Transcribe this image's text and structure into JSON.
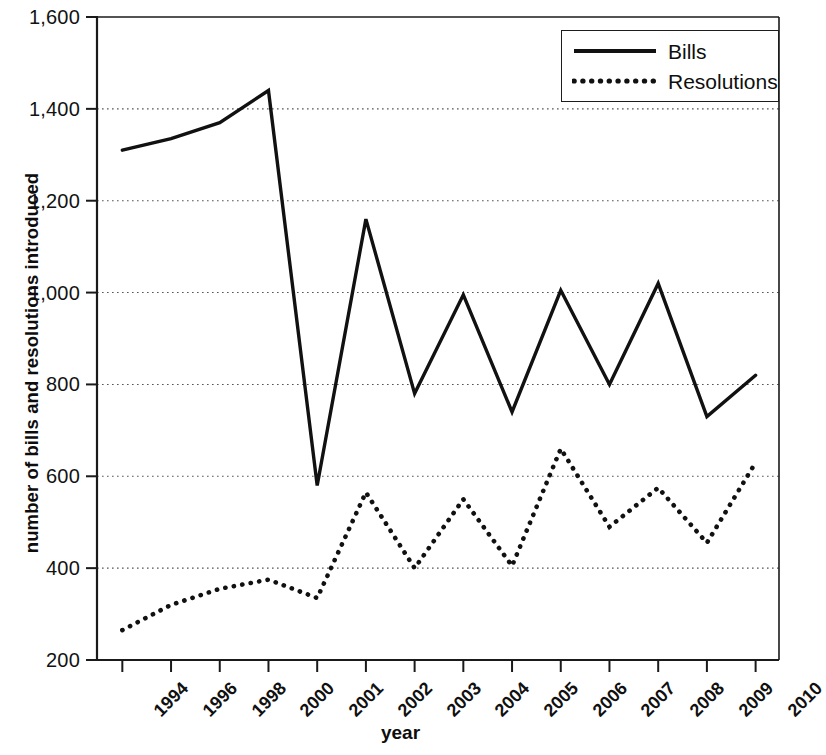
{
  "chart_data": {
    "type": "line",
    "title": "",
    "xlabel": "year",
    "ylabel": "number of bills and resolutions introduced",
    "categories": [
      "1994",
      "1996",
      "1998",
      "2000",
      "2001",
      "2002",
      "2003",
      "2004",
      "2005",
      "2006",
      "2007",
      "2008",
      "2009",
      "2010"
    ],
    "ylim": [
      200,
      1600
    ],
    "ytick_labels": [
      "1,600",
      "1,400",
      "1,200",
      "1,000",
      "800",
      "600",
      "400",
      "200"
    ],
    "ytick_values": [
      1600,
      1400,
      1200,
      1000,
      800,
      600,
      400,
      200
    ],
    "grid": true,
    "legend_position": "top-right",
    "series": [
      {
        "name": "Bills",
        "style": "solid",
        "color": "#111111",
        "values": [
          1310,
          1335,
          1370,
          1440,
          580,
          1160,
          780,
          995,
          740,
          1005,
          800,
          1020,
          730,
          820
        ]
      },
      {
        "name": "Resolutions",
        "style": "dotted",
        "color": "#111111",
        "values": [
          265,
          320,
          355,
          375,
          335,
          565,
          400,
          550,
          405,
          660,
          490,
          575,
          455,
          630
        ]
      }
    ]
  },
  "legend": {
    "items": [
      {
        "label": "Bills",
        "style": "solid"
      },
      {
        "label": "Resolutions",
        "style": "dotted"
      }
    ]
  }
}
